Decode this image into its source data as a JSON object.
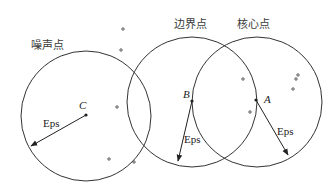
{
  "labels": {
    "noise_point": "噪声点",
    "border_point": "边界点",
    "core_point": "核心点",
    "point_a": "A",
    "point_b": "B",
    "point_c": "C",
    "eps_c": "Eps",
    "eps_b": "Eps",
    "eps_a": "Eps"
  },
  "colors": {
    "stroke": "#333333",
    "text": "#3a3a3a"
  },
  "circles": [
    {
      "name": "circle-c",
      "cx": 86,
      "cy": 116,
      "r": 65
    },
    {
      "name": "circle-b",
      "cx": 192,
      "cy": 102,
      "r": 65
    },
    {
      "name": "circle-a",
      "cx": 257,
      "cy": 102,
      "r": 65
    }
  ]
}
